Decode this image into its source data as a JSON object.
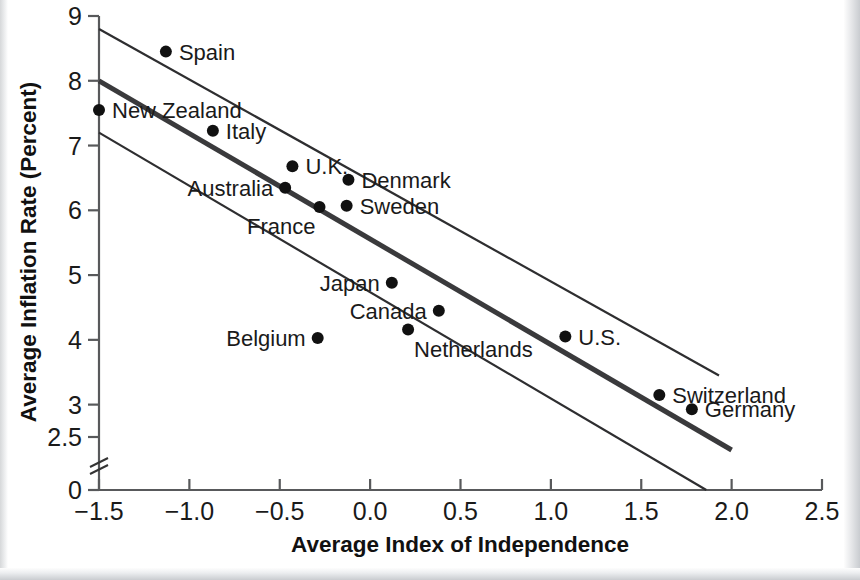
{
  "chart_data": {
    "type": "scatter",
    "title": "",
    "xlabel": "Average Index of Independence",
    "ylabel": "Average Inflation Rate (Percent)",
    "xlim": [
      -1.5,
      2.5
    ],
    "ylim": [
      2.3,
      9.0
    ],
    "grid": false,
    "legend": "none",
    "y_axis_break": true,
    "y_axis_break_note": "axis broken between 0 and 2.5",
    "xticks": [
      "-1.5",
      "-1.0",
      "-0.5",
      "0.0",
      "0.5",
      "1.0",
      "1.5",
      "2.0",
      "2.5"
    ],
    "xtick_values": [
      -1.5,
      -1.0,
      -0.5,
      0.0,
      0.5,
      1.0,
      1.5,
      2.0,
      2.5
    ],
    "yticks": [
      "0",
      "2.5",
      "3",
      "4",
      "5",
      "6",
      "7",
      "8",
      "9"
    ],
    "ytick_values": [
      0,
      2.5,
      3,
      4,
      5,
      6,
      7,
      8,
      9
    ],
    "points": [
      {
        "label": "Spain",
        "x": -1.13,
        "y": 8.45,
        "label_side": "right"
      },
      {
        "label": "New Zealand",
        "x": -1.5,
        "y": 7.55,
        "label_side": "right"
      },
      {
        "label": "Italy",
        "x": -0.87,
        "y": 7.23,
        "label_side": "right"
      },
      {
        "label": "U.K.",
        "x": -0.43,
        "y": 6.68,
        "label_side": "right"
      },
      {
        "label": "Denmark",
        "x": -0.12,
        "y": 6.47,
        "label_side": "right"
      },
      {
        "label": "Australia",
        "x": -0.47,
        "y": 6.35,
        "label_side": "left"
      },
      {
        "label": "Sweden",
        "x": -0.13,
        "y": 6.07,
        "label_side": "right"
      },
      {
        "label": "France",
        "x": -0.28,
        "y": 6.05,
        "label_side": "left-below"
      },
      {
        "label": "Japan",
        "x": 0.12,
        "y": 4.88,
        "label_side": "left"
      },
      {
        "label": "Canada",
        "x": 0.38,
        "y": 4.45,
        "label_side": "left"
      },
      {
        "label": "Netherlands",
        "x": 0.21,
        "y": 4.16,
        "label_side": "below"
      },
      {
        "label": "Belgium",
        "x": -0.29,
        "y": 4.03,
        "label_side": "left"
      },
      {
        "label": "U.S.",
        "x": 1.08,
        "y": 4.05,
        "label_side": "right"
      },
      {
        "label": "Switzerland",
        "x": 1.6,
        "y": 3.15,
        "label_side": "right"
      },
      {
        "label": "Germany",
        "x": 1.78,
        "y": 2.93,
        "label_side": "right"
      }
    ],
    "series": [
      {
        "name": "regression-fit",
        "type": "line",
        "style": "thick",
        "x": [
          -1.5,
          2.0
        ],
        "y": [
          8.0,
          2.3
        ]
      },
      {
        "name": "upper-confidence-band",
        "type": "line",
        "style": "thin",
        "x": [
          -1.5,
          1.93
        ],
        "y": [
          8.8,
          3.45
        ]
      },
      {
        "name": "lower-confidence-band",
        "type": "line",
        "style": "thin",
        "x": [
          -1.5,
          1.86
        ],
        "y": [
          7.2,
          0.0
        ]
      }
    ]
  },
  "colors": {
    "point": "#111111",
    "fit_line": "#3a3a3c",
    "band_line": "#2e2e30",
    "axis": "#58595b",
    "background": "#ffffff"
  }
}
